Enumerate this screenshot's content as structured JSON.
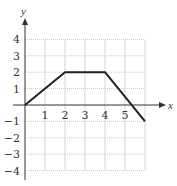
{
  "chart_data": {
    "type": "line",
    "title": "",
    "xlabel": "x",
    "ylabel": "y",
    "x": [
      0,
      2,
      4,
      6
    ],
    "series": [
      {
        "name": "piecewise",
        "x": [
          0,
          2,
          4,
          6
        ],
        "values": [
          0,
          2,
          2,
          -1
        ]
      }
    ],
    "xticks": [
      "1",
      "2",
      "3",
      "4",
      "5"
    ],
    "yticks": [
      "4",
      "3",
      "2",
      "1",
      "−1",
      "−2",
      "−3",
      "−4"
    ],
    "xlim": [
      0,
      6
    ],
    "ylim": [
      -4,
      4
    ],
    "grid": true,
    "colors": {
      "line": "#222222",
      "grid": "#bbbbbb",
      "axis": "#333333"
    }
  }
}
